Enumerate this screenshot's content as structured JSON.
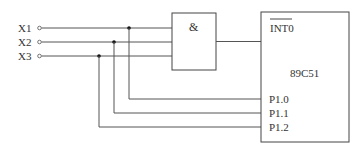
{
  "diagram": {
    "type": "logic-circuit",
    "inputs": [
      {
        "label": "X1",
        "y": 28,
        "tap_x": 129,
        "pin": "P1.0",
        "pin_y": 99
      },
      {
        "label": "X2",
        "y": 42,
        "tap_x": 114,
        "pin": "P1.1",
        "pin_y": 113
      },
      {
        "label": "X3",
        "y": 56,
        "tap_x": 99,
        "pin": "P1.2",
        "pin_y": 127
      }
    ],
    "gate": {
      "symbol": "&",
      "type": "AND"
    },
    "chip": {
      "name": "89C51",
      "interrupt_pin": "INT0",
      "ports": [
        "P1.0",
        "P1.1",
        "P1.2"
      ]
    },
    "colors": {
      "line": "#555555",
      "text": "#333333",
      "background": "#ffffff"
    }
  }
}
